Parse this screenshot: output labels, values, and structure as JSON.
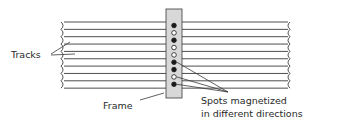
{
  "labels": {
    "tracks": "Tracks",
    "frame": "Frame",
    "spots_line1": "Spots magnetized",
    "spots_line2": "in different directions"
  },
  "colors": {
    "line": "#3a3a3a",
    "frame_fill": "#d8d8d8",
    "spot_filled": "#1a1a1a",
    "spot_open": "#ffffff"
  },
  "tracks": {
    "count": 10
  },
  "spots": [
    {
      "state": "filled"
    },
    {
      "state": "open"
    },
    {
      "state": "filled"
    },
    {
      "state": "open"
    },
    {
      "state": "open"
    },
    {
      "state": "filled"
    },
    {
      "state": "filled"
    },
    {
      "state": "open"
    },
    {
      "state": "filled"
    }
  ]
}
